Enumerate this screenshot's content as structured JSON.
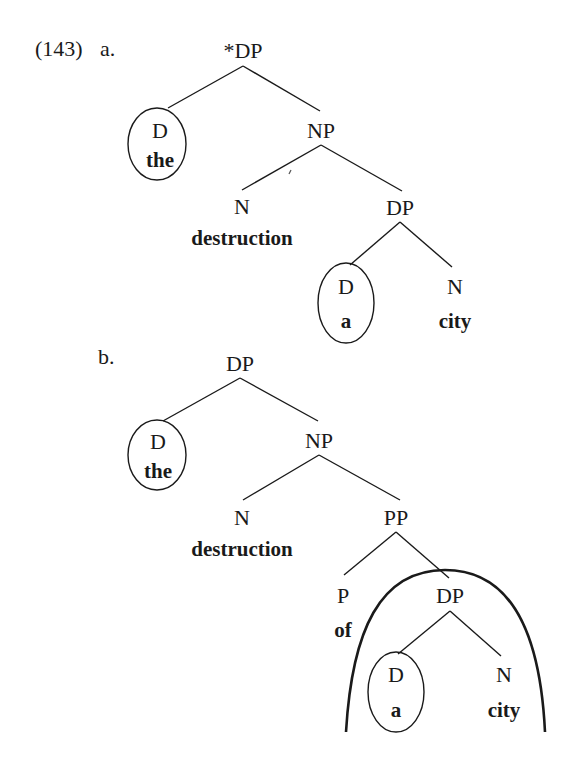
{
  "example": {
    "number": "(143)",
    "a": {
      "label": "a.",
      "root": "*DP",
      "d1": {
        "cat": "D",
        "word": "the"
      },
      "np": "NP",
      "n1": {
        "cat": "N",
        "word": "destruction"
      },
      "dp2": "DP",
      "d2": {
        "cat": "D",
        "word": "a"
      },
      "n2": {
        "cat": "N",
        "word": "city"
      }
    },
    "b": {
      "label": "b.",
      "root": "DP",
      "d1": {
        "cat": "D",
        "word": "the"
      },
      "np": "NP",
      "n1": {
        "cat": "N",
        "word": "destruction"
      },
      "pp": "PP",
      "p": {
        "cat": "P",
        "word": "of"
      },
      "dp2": "DP",
      "d2": {
        "cat": "D",
        "word": "a"
      },
      "n2": {
        "cat": "N",
        "word": "city"
      }
    }
  }
}
